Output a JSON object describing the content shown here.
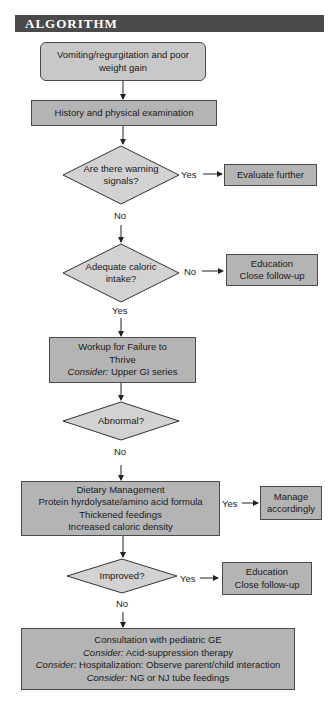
{
  "header": {
    "title": "ALGORITHM"
  },
  "nodes": {
    "start": {
      "lines": [
        "Vomiting/regurgitation and poor",
        "weight gain"
      ]
    },
    "history": {
      "lines": [
        "History and physical examination"
      ]
    },
    "warning": {
      "lines": [
        "Are there warning",
        "signals?"
      ]
    },
    "evaluate": {
      "lines": [
        "Evaluate further"
      ]
    },
    "caloric": {
      "lines": [
        "Adequate caloric",
        "intake?"
      ]
    },
    "education1": {
      "lines": [
        "Education",
        "Close follow-up"
      ]
    },
    "workup": {
      "line1": "Workup for Failure to",
      "line2": "Thrive",
      "consider_label": "Consider:",
      "consider_text": " Upper GI series"
    },
    "abnormal": {
      "lines": [
        "Abnormal?"
      ]
    },
    "dietary": {
      "lines": [
        "Dietary Management",
        "Protein hyrdolysate/amino acid formula",
        "Thickened feedings",
        "Increased caloric density"
      ]
    },
    "manage": {
      "lines": [
        "Manage",
        "accordingly"
      ]
    },
    "improved": {
      "lines": [
        "Improved?"
      ]
    },
    "education2": {
      "lines": [
        "Education",
        "Close follow-up"
      ]
    },
    "consult": {
      "line1": "Consultation with pediatric GE",
      "consider_label": "Consider:",
      "c1": " Acid-suppression therapy",
      "c2": " Hospitalization: Observe parent/child interaction",
      "c3": " NG or NJ tube feedings"
    }
  },
  "edge_labels": {
    "warning_yes": "Yes",
    "warning_no": "No",
    "caloric_no": "No",
    "caloric_yes": "Yes",
    "abnormal_no": "No",
    "dietary_yes": "Yes",
    "improved_yes": "Yes",
    "improved_no": "No"
  },
  "colors": {
    "box_fill": "#b4b4b4",
    "start_fill": "#c8c8c8",
    "diamond_fill": "#d2d2d2",
    "header_bg": "#4a4a4a",
    "stroke": "#333333"
  }
}
